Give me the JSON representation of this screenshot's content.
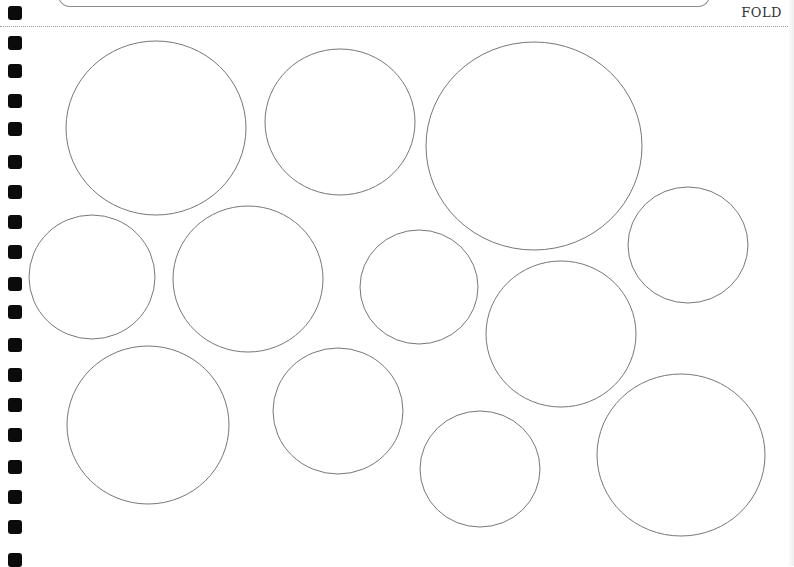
{
  "page": {
    "fold_label": "FOLD",
    "colors": {
      "circle_stroke": "#777777",
      "fold_line": "#999999",
      "holes": "#0b0b0b"
    }
  },
  "binding_holes": [
    {
      "y": 6
    },
    {
      "y": 36
    },
    {
      "y": 64
    },
    {
      "y": 94
    },
    {
      "y": 122
    },
    {
      "y": 155
    },
    {
      "y": 185
    },
    {
      "y": 215
    },
    {
      "y": 245
    },
    {
      "y": 277
    },
    {
      "y": 305
    },
    {
      "y": 338
    },
    {
      "y": 368
    },
    {
      "y": 398
    },
    {
      "y": 428
    },
    {
      "y": 460
    },
    {
      "y": 490
    },
    {
      "y": 520
    },
    {
      "y": 553
    }
  ],
  "circles": [
    {
      "cx": 156,
      "cy": 128,
      "rx": 90,
      "ry": 87
    },
    {
      "cx": 340,
      "cy": 122,
      "rx": 75,
      "ry": 73
    },
    {
      "cx": 534,
      "cy": 146,
      "rx": 108,
      "ry": 104
    },
    {
      "cx": 688,
      "cy": 245,
      "rx": 60,
      "ry": 58
    },
    {
      "cx": 92,
      "cy": 277,
      "rx": 63,
      "ry": 62
    },
    {
      "cx": 248,
      "cy": 279,
      "rx": 75,
      "ry": 73
    },
    {
      "cx": 419,
      "cy": 287,
      "rx": 59,
      "ry": 57
    },
    {
      "cx": 561,
      "cy": 334,
      "rx": 75,
      "ry": 73
    },
    {
      "cx": 148,
      "cy": 425,
      "rx": 81,
      "ry": 79
    },
    {
      "cx": 338,
      "cy": 411,
      "rx": 65,
      "ry": 63
    },
    {
      "cx": 480,
      "cy": 469,
      "rx": 60,
      "ry": 58
    },
    {
      "cx": 681,
      "cy": 455,
      "rx": 84,
      "ry": 81
    }
  ]
}
